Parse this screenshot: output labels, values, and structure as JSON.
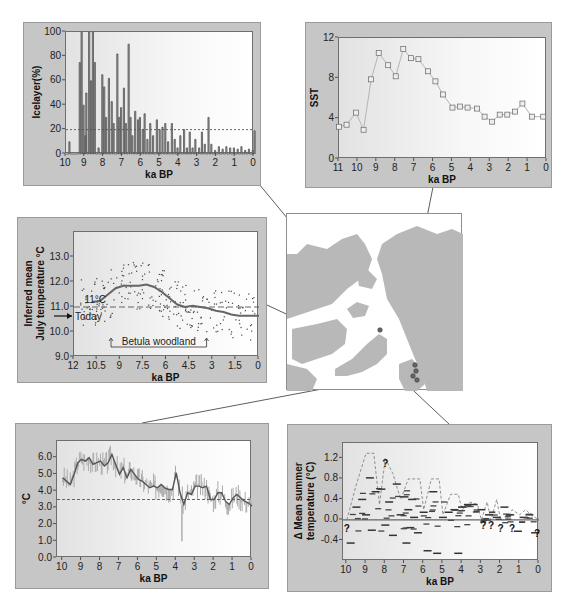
{
  "chart_data": [
    {
      "id": "icelayer",
      "type": "bar",
      "title": "",
      "xlabel": "ka BP",
      "ylabel": "Icelayer(%)",
      "xlim": [
        10,
        0
      ],
      "ylim": [
        0,
        100
      ],
      "xticks": [
        "10",
        "9",
        "8",
        "7",
        "6",
        "5",
        "4",
        "3",
        "2",
        "1",
        "0"
      ],
      "yticks": [
        "0",
        "20",
        "40",
        "60",
        "80",
        "100"
      ],
      "reference_line": {
        "y": 20,
        "style": "dashed"
      },
      "x": [
        9.85,
        9.3,
        9.2,
        9.1,
        9.0,
        8.95,
        8.8,
        8.7,
        8.6,
        8.5,
        8.3,
        8.1,
        8.0,
        7.9,
        7.75,
        7.6,
        7.5,
        7.3,
        7.2,
        7.1,
        6.95,
        6.85,
        6.7,
        6.6,
        6.5,
        6.35,
        6.2,
        6.1,
        5.95,
        5.85,
        5.7,
        5.55,
        5.4,
        5.2,
        5.05,
        4.9,
        4.75,
        4.6,
        4.4,
        4.25,
        4.1,
        3.95,
        3.75,
        3.6,
        3.45,
        3.3,
        3.15,
        2.95,
        2.8,
        2.65,
        2.45,
        2.3,
        2.1,
        1.9,
        1.7,
        1.5,
        1.3,
        1.1,
        0.9,
        0.7,
        0.5,
        0.3,
        0.1,
        0.0
      ],
      "values": [
        10,
        75,
        100,
        40,
        15,
        50,
        100,
        60,
        100,
        75,
        5,
        65,
        55,
        30,
        62,
        43,
        25,
        82,
        30,
        38,
        54,
        25,
        90,
        30,
        15,
        35,
        28,
        30,
        20,
        33,
        12,
        25,
        15,
        28,
        20,
        22,
        25,
        10,
        25,
        12,
        5,
        15,
        20,
        5,
        18,
        5,
        12,
        5,
        18,
        8,
        30,
        8,
        3,
        6,
        4,
        6,
        5,
        5,
        4,
        6,
        3,
        4,
        3,
        19
      ]
    },
    {
      "id": "sst",
      "type": "line",
      "title": "",
      "xlabel": "ka BP",
      "ylabel": "SST",
      "xlim": [
        11,
        0
      ],
      "ylim": [
        0,
        12
      ],
      "xticks": [
        "11",
        "10",
        "9",
        "8",
        "7",
        "6",
        "5",
        "4",
        "3",
        "2",
        "1",
        "0"
      ],
      "yticks": [
        "0",
        "4",
        "8",
        "12"
      ],
      "marker": "square",
      "x": [
        11.0,
        10.6,
        10.1,
        9.7,
        9.3,
        8.9,
        8.4,
        8.0,
        7.6,
        7.2,
        6.8,
        6.3,
        5.9,
        5.5,
        5.0,
        4.6,
        4.2,
        3.7,
        3.3,
        2.9,
        2.5,
        2.1,
        1.7,
        1.3,
        0.8,
        0.2
      ],
      "values": [
        3.2,
        3.4,
        4.6,
        2.9,
        7.9,
        10.5,
        9.3,
        8.2,
        10.9,
        10.0,
        9.9,
        8.7,
        7.7,
        6.4,
        5.1,
        5.2,
        5.1,
        5.0,
        4.2,
        3.7,
        4.4,
        4.4,
        4.7,
        5.5,
        4.2,
        4.2
      ]
    },
    {
      "id": "july-temperature",
      "type": "scatter",
      "title": "",
      "xlabel": "ka BP",
      "ylabel": "Inferred mean July temperature °C",
      "xlim": [
        12,
        0
      ],
      "ylim": [
        9.0,
        14.0
      ],
      "xticks": [
        "12",
        "10.5",
        "9",
        "7.5",
        "6",
        "4.5",
        "3",
        "1.5",
        "0"
      ],
      "yticks": [
        "9.0",
        "10.0",
        "11.0",
        "12.0",
        "13.0"
      ],
      "reference_line": {
        "y": 11.0,
        "style": "dashed"
      },
      "smoothed_curve": {
        "x": [
          10.8,
          10.3,
          9.8,
          9.3,
          8.8,
          8.3,
          7.8,
          7.3,
          6.8,
          6.3,
          5.8,
          5.3,
          4.8,
          4.3,
          3.8,
          3.3,
          2.8,
          2.3,
          1.8,
          1.3,
          0.8,
          0.3,
          0.0
        ],
        "values": [
          11.2,
          11.25,
          11.5,
          11.75,
          11.85,
          11.85,
          11.85,
          11.9,
          11.8,
          11.6,
          11.35,
          11.1,
          11.0,
          11.05,
          11.0,
          10.95,
          10.85,
          10.8,
          10.7,
          10.65,
          10.65,
          10.65,
          10.65
        ]
      },
      "annotations": [
        {
          "text": "11°C",
          "x": 11.0,
          "y": 11.3
        },
        {
          "text": "Today",
          "y": 10.6,
          "arrow": true
        },
        {
          "text": "Betula woodland",
          "x_range": [
            9.6,
            3.4
          ],
          "y": 9.4
        }
      ]
    },
    {
      "id": "summer-temperature-c",
      "type": "line",
      "title": "",
      "xlabel": "ka BP",
      "ylabel": "°C",
      "xlim": [
        10.3,
        0
      ],
      "ylim": [
        0.0,
        7.0
      ],
      "xticks": [
        "10",
        "9",
        "8",
        "7",
        "6",
        "5",
        "4",
        "3",
        "2",
        "1",
        "0"
      ],
      "yticks": [
        "0.0",
        "1.0",
        "2.0",
        "3.0",
        "4.0",
        "5.0",
        "6.0"
      ],
      "reference_line": {
        "y": 3.5,
        "style": "dashed"
      },
      "x": [
        10.0,
        9.8,
        9.6,
        9.4,
        9.2,
        9.0,
        8.8,
        8.6,
        8.4,
        8.2,
        8.0,
        7.8,
        7.6,
        7.4,
        7.2,
        7.0,
        6.8,
        6.6,
        6.4,
        6.2,
        6.0,
        5.8,
        5.6,
        5.4,
        5.2,
        5.0,
        4.8,
        4.6,
        4.4,
        4.2,
        4.0,
        3.8,
        3.6,
        3.4,
        3.2,
        3.0,
        2.8,
        2.6,
        2.4,
        2.2,
        2.0,
        1.8,
        1.6,
        1.4,
        1.2,
        1.0,
        0.8,
        0.6,
        0.4,
        0.2,
        0.0
      ],
      "values": [
        4.8,
        4.6,
        4.4,
        5.0,
        5.7,
        5.9,
        5.8,
        6.0,
        5.6,
        5.7,
        5.8,
        5.5,
        5.7,
        6.2,
        5.6,
        5.0,
        5.4,
        4.8,
        5.3,
        5.0,
        4.7,
        4.6,
        4.4,
        4.2,
        4.3,
        4.2,
        4.4,
        4.2,
        4.1,
        4.1,
        5.1,
        3.9,
        3.2,
        3.9,
        3.8,
        4.3,
        4.3,
        4.2,
        4.3,
        3.5,
        3.5,
        3.9,
        3.9,
        3.4,
        3.2,
        3.6,
        3.8,
        3.6,
        3.4,
        3.3,
        3.1
      ]
    },
    {
      "id": "delta-mean-summer-temperature",
      "type": "scatter",
      "title": "",
      "xlabel": "ka BP",
      "ylabel": "Δ Mean summer temperature (°C)",
      "xlim": [
        10.2,
        0
      ],
      "ylim": [
        -0.8,
        1.5
      ],
      "xticks": [
        "10",
        "9",
        "8",
        "7",
        "6",
        "5",
        "4",
        "3",
        "2",
        "1",
        "0"
      ],
      "yticks": [
        "-0.4",
        "0.0",
        "0.4",
        "0.8",
        "1.2"
      ],
      "reference_line": {
        "y": 0.0,
        "style": "solid"
      },
      "envelope": {
        "x": [
          10.0,
          9.5,
          9.0,
          8.6,
          8.3,
          8.0,
          7.6,
          7.2,
          6.8,
          6.2,
          6.0,
          5.6,
          5.2,
          5.0,
          4.6,
          4.2,
          4.0,
          3.6,
          3.2,
          3.0,
          2.7,
          2.5,
          2.2,
          2.0,
          1.7,
          1.4,
          1.0,
          0.7,
          0.4,
          0.0
        ],
        "values": [
          0.0,
          0.7,
          1.3,
          1.3,
          0.3,
          1.2,
          0.9,
          0.4,
          0.8,
          0.8,
          0.2,
          0.8,
          0.8,
          0.1,
          0.5,
          0.5,
          0.2,
          0.35,
          0.3,
          0.0,
          0.35,
          0.0,
          0.4,
          0.0,
          0.0,
          0.2,
          0.1,
          0.2,
          0.1,
          0.0
        ]
      },
      "question_marks": [
        {
          "x": 10.0,
          "y": -0.05
        },
        {
          "x": 8.0,
          "y": 1.2
        },
        {
          "x": 2.9,
          "y": 0.0
        },
        {
          "x": 2.5,
          "y": 0.0
        },
        {
          "x": 2.0,
          "y": -0.05
        },
        {
          "x": 1.4,
          "y": -0.05
        },
        {
          "x": 0.1,
          "y": -0.15
        }
      ],
      "segments_x": [
        9.8,
        9.5,
        9.2,
        9.0,
        8.8,
        8.7,
        8.5,
        8.2,
        8.0,
        7.8,
        7.6,
        7.4,
        7.2,
        7.0,
        6.9,
        6.8,
        6.7,
        6.6,
        6.5,
        6.3,
        6.0,
        5.8,
        5.5,
        5.3,
        5.0,
        4.7,
        4.4,
        4.2,
        4.0,
        3.7,
        3.4,
        3.0,
        2.6,
        2.2,
        1.8,
        1.5,
        1.1,
        0.8,
        0.5,
        0.2
      ],
      "segments_y": [
        -0.45,
        0.25,
        0.4,
        0.1,
        0.82,
        -0.2,
        0.55,
        0.6,
        -0.1,
        0.35,
        -0.3,
        0.7,
        0.1,
        0.45,
        -0.45,
        0.2,
        -0.15,
        0.4,
        0.05,
        -0.25,
        0.15,
        -0.6,
        0.55,
        -0.65,
        0.05,
        0.15,
        0.2,
        -0.65,
        0.25,
        0.3,
        0.3,
        0.2,
        0.1,
        0.05,
        0.25,
        0.1,
        -0.22,
        0.05,
        0.1,
        -0.25
      ]
    }
  ],
  "map": {
    "label": "Arctic region map with site markers",
    "sites": [
      {
        "x": 93,
        "y": 116
      },
      {
        "x": 128,
        "y": 151
      },
      {
        "x": 129,
        "y": 157
      },
      {
        "x": 126,
        "y": 162
      },
      {
        "x": 130,
        "y": 166
      }
    ]
  }
}
